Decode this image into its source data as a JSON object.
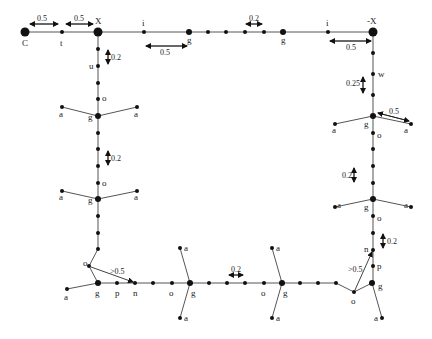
{
  "diagram": {
    "type": "graph-layout",
    "node_labels": {
      "C": "C",
      "t": "t",
      "X": "X",
      "negX": "-X",
      "i": "i",
      "g": "g",
      "u": "u",
      "o": "o",
      "a": "a",
      "w": "w",
      "n": "n",
      "p": "p"
    },
    "dimension_labels": {
      "d_C_t": "0.5",
      "d_t_X": "0.5",
      "d_i_g": "0.5",
      "d_top_small": "0.2",
      "d_i_negX": "0.5",
      "d_left_u": "0.2",
      "d_left_mid": "0.2",
      "d_right_w": "0.25",
      "d_right_a": "0.5",
      "d_right_mid": "0.2",
      "d_right_low": "0.2",
      "d_bottom_left": ">0.5",
      "d_bottom_mid": "0.2",
      "d_bottom_right": ">0.5"
    }
  }
}
